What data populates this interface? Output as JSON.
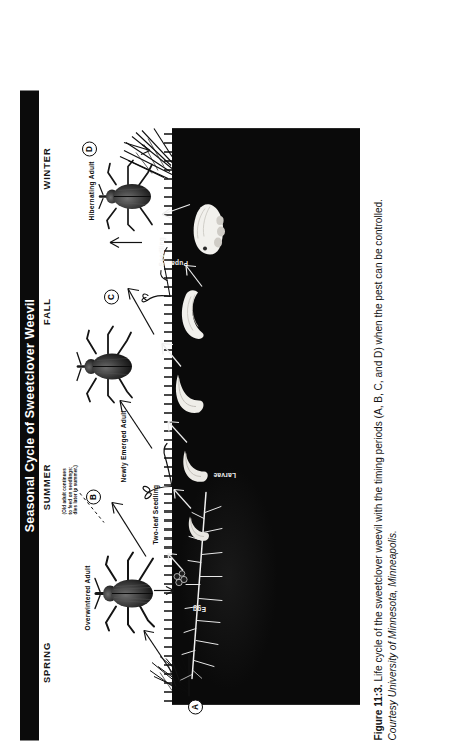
{
  "figure": {
    "banner_title": "Seasonal Cycle of Sweetclover Weevil",
    "seasons": [
      {
        "label": "SPRING",
        "pos_pct": 12
      },
      {
        "label": "SUMMER",
        "pos_pct": 39
      },
      {
        "label": "FALL",
        "pos_pct": 66
      },
      {
        "label": "WINTER",
        "pos_pct": 88
      }
    ],
    "markers": [
      {
        "id": "A",
        "label": "A"
      },
      {
        "id": "B",
        "label": "B"
      },
      {
        "id": "C",
        "label": "C"
      },
      {
        "id": "D",
        "label": "D"
      }
    ],
    "stage_labels": {
      "overwintered_adult": "Overwintered Adult",
      "two_leaf_seedling": "Two-leaf Seedling",
      "newly_emerged_adult": "Newly Emerged Adult",
      "hibernating_adult": "Hibernating Adult",
      "seedling": "Seedling",
      "egg": "Egg",
      "larvae": "Larvae",
      "pupa": "Pupa"
    },
    "annotation_note": "(Old adult continues\nto feed on seedlings;\ndies later in summer.)"
  },
  "caption": {
    "figure_number": "Figure 11:3.",
    "text": " Life cycle of the sweetclover weevil with the timing periods (A, B, C, and D) when the pest can be controlled.",
    "credit": "Courtesy University of Minnesota, Minneapolis."
  },
  "colors": {
    "banner_background": "#0b0b0b",
    "banner_text": "#ffffff",
    "soil_background": "#060606",
    "page_background": "#ffffff",
    "ink": "#111111"
  }
}
